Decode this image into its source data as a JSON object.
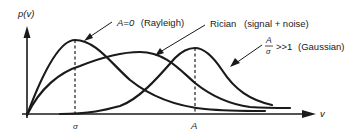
{
  "diagram": {
    "y_axis_label": "p(v)",
    "x_axis_label": "v",
    "ticks": [
      {
        "label": "σ",
        "x": 75
      },
      {
        "label": "A",
        "x": 195
      }
    ],
    "curves": [
      {
        "id": "rayleigh",
        "label_main": "A=0",
        "label_note": "(Rayleigh)",
        "peak_at": "σ"
      },
      {
        "id": "rician",
        "label_main": "Rician",
        "label_note": "(signal + noise)"
      },
      {
        "id": "gaussian",
        "label_num": "A",
        "label_den": "σ",
        "label_rel": ">>1",
        "label_note": "(Gaussian)",
        "peak_at": "A"
      }
    ],
    "colors": {
      "ink": "#1a1a1a",
      "background": "#ffffff"
    }
  }
}
